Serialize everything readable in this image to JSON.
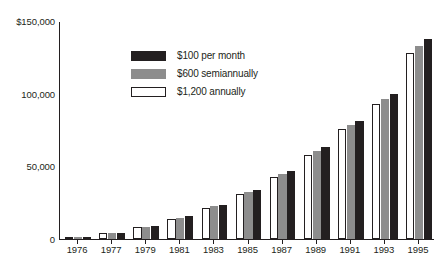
{
  "chart_data": {
    "type": "bar",
    "title": "",
    "subtitle": "",
    "xlabel": "",
    "ylabel": "",
    "ylim": [
      0,
      150000
    ],
    "yticks": [
      0,
      50000,
      100000,
      150000
    ],
    "ytick_labels": [
      "0",
      "50,000",
      "100,000",
      "$150,000"
    ],
    "grid": false,
    "legend_position": "top-left",
    "categories": [
      "1976",
      "1977",
      "1979",
      "1981",
      "1983",
      "1985",
      "1987",
      "1989",
      "1991",
      "1993",
      "1995"
    ],
    "series": [
      {
        "name": "$1,200 annually",
        "color": "#ffffff",
        "edge_color": "#231f20",
        "values": [
          1200,
          3900,
          8200,
          14000,
          21500,
          31000,
          43000,
          58000,
          75500,
          93000,
          128000
        ]
      },
      {
        "name": "$600 semiannually",
        "color": "#8d8d8d",
        "edge_color": "#8d8d8d",
        "values": [
          1250,
          4100,
          8600,
          14800,
          22600,
          32500,
          45000,
          60500,
          78500,
          96500,
          133000
        ]
      },
      {
        "name": "$100 per month",
        "color": "#231f20",
        "edge_color": "#231f20",
        "values": [
          1300,
          4300,
          9000,
          15500,
          23600,
          34000,
          47000,
          63000,
          81500,
          99500,
          137500
        ]
      }
    ]
  },
  "legend": {
    "items": [
      {
        "label": "$100 per month",
        "style": "s-monthly"
      },
      {
        "label": "$600 semiannually",
        "style": "s-semiannual"
      },
      {
        "label": "$1,200 annually",
        "style": "s-annual"
      }
    ]
  },
  "axes": {
    "y": {
      "ticks": [
        {
          "value": 150000,
          "label": "$150,000"
        },
        {
          "value": 100000,
          "label": "100,000"
        },
        {
          "value": 50000,
          "label": "50,000"
        },
        {
          "value": 0,
          "label": "0"
        }
      ]
    },
    "x": {
      "ticks": [
        "1976",
        "1977",
        "1979",
        "1981",
        "1983",
        "1985",
        "1987",
        "1989",
        "1991",
        "1993",
        "1995"
      ]
    }
  }
}
